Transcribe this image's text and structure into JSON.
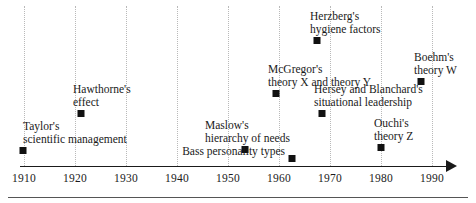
{
  "figure": {
    "background_color": "#ffffff",
    "marker_color": "#111111",
    "axis_color": "#1a1a1a",
    "gridline_color": "#b9b9b9"
  },
  "axis": {
    "label": "",
    "ticks": [
      {
        "label": "1910",
        "value": 1910
      },
      {
        "label": "1920",
        "value": 1920
      },
      {
        "label": "1930",
        "value": 1930
      },
      {
        "label": "1940",
        "value": 1940
      },
      {
        "label": "1950",
        "value": 1950
      },
      {
        "label": "1960",
        "value": 1960
      },
      {
        "label": "1970",
        "value": 1970
      },
      {
        "label": "1980",
        "value": 1980
      },
      {
        "label": "1990",
        "value": 1990
      }
    ],
    "range": [
      1910,
      1990
    ],
    "arrow": true,
    "gridlines": true
  },
  "chart_data": {
    "type": "scatter",
    "title": "",
    "xlabel": "",
    "ylabel": "",
    "xlim": [
      1910,
      1990
    ],
    "grid": true,
    "legend": "none",
    "categories": [
      "Taylor's scientific management",
      "Hawthorne's effect",
      "Maslow's hierarchy of needs",
      "McGregor's theory X and theory Y",
      "Bass personality types",
      "Herzberg's hygiene factors",
      "Hersey and Blanchard's situational leadership",
      "Ouchi's theory Z",
      "Boehm's theory W"
    ],
    "x": [
      1910,
      1922,
      1954,
      1959,
      1962,
      1967,
      1969,
      1981,
      1988
    ],
    "values": [
      1910,
      1922,
      1954,
      1959,
      1962,
      1967,
      1969,
      1981,
      1988
    ]
  },
  "events": [
    {
      "id": "taylor",
      "lines": [
        "Taylor's",
        "scientific management"
      ],
      "year": 1910,
      "marker_x": 23,
      "marker_y": 147,
      "label_x": 23,
      "label_y": 120,
      "anchor": "left"
    },
    {
      "id": "hawthorne",
      "lines": [
        "Hawthorne's",
        "effect"
      ],
      "year": 1922,
      "marker_x": 81,
      "marker_y": 110,
      "label_x": 73,
      "label_y": 83,
      "anchor": "left"
    },
    {
      "id": "maslow",
      "lines": [
        "Maslow's",
        "hierarchy of needs"
      ],
      "year": 1954,
      "marker_x": 245,
      "marker_y": 146,
      "label_x": 205,
      "label_y": 119,
      "anchor": "left"
    },
    {
      "id": "mcgregor",
      "lines": [
        "McGregor's",
        "theory X and theory Y"
      ],
      "year": 1959,
      "marker_x": 276,
      "marker_y": 90,
      "label_x": 268,
      "label_y": 63,
      "anchor": "left"
    },
    {
      "id": "bass",
      "lines": [
        "Bass personality types"
      ],
      "year": 1962,
      "marker_x": 292,
      "marker_y": 155,
      "label_x": 285,
      "label_y": 145,
      "anchor": "right"
    },
    {
      "id": "herzberg",
      "lines": [
        "Herzberg's",
        "hygiene factors"
      ],
      "year": 1967,
      "marker_x": 317,
      "marker_y": 37,
      "label_x": 310,
      "label_y": 10,
      "anchor": "left"
    },
    {
      "id": "hersey-blanchard",
      "lines": [
        "Hersey and Blanchard's",
        "situational leadership"
      ],
      "year": 1969,
      "marker_x": 322,
      "marker_y": 110,
      "label_x": 314,
      "label_y": 83,
      "anchor": "left"
    },
    {
      "id": "ouchi",
      "lines": [
        "Ouchi's",
        "theory Z"
      ],
      "year": 1981,
      "marker_x": 381,
      "marker_y": 144,
      "label_x": 374,
      "label_y": 117,
      "anchor": "left"
    },
    {
      "id": "boehm",
      "lines": [
        "Boehm's",
        "theory W"
      ],
      "year": 1988,
      "marker_x": 421,
      "marker_y": 78,
      "label_x": 414,
      "label_y": 51,
      "anchor": "left"
    }
  ]
}
